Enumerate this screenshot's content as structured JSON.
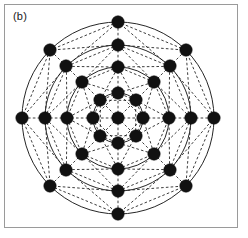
{
  "figure": {
    "panel_label": "(b)",
    "caption_text": "(b)",
    "background_color": "#ffffff",
    "frame_color": "#9a9a9a",
    "node_color": "#111111",
    "solid_edge_color": "#1a1a1a",
    "dashed_edge_color": "#1a1a1a"
  },
  "chart_data": {
    "type": "scatter",
    "title": "(b)",
    "subtitle": "",
    "xlabel": "",
    "ylabel": "",
    "grid": false,
    "legend_position": "none",
    "node_count": 33,
    "ring_count": 4,
    "nodes_per_ring": 8,
    "center": {
      "x": 118,
      "y": 118
    },
    "ring_radii": [
      25,
      51,
      73,
      96
    ],
    "ring_angles_deg": [
      0,
      45,
      90,
      135,
      180,
      225,
      270,
      315
    ],
    "node_radius_px": 6.2,
    "axis_node_x_positions": [
      22,
      45,
      67,
      93,
      118,
      143,
      168,
      191,
      214
    ],
    "axis_node_y_positions": [
      22,
      45,
      67,
      93,
      118,
      143,
      168,
      191,
      214
    ],
    "circles": [
      {
        "name": "ring-1",
        "radius": 25,
        "style": "solid"
      },
      {
        "name": "ring-2",
        "radius": 51,
        "style": "solid"
      },
      {
        "name": "ring-3",
        "radius": 73,
        "style": "solid"
      },
      {
        "name": "ring-4",
        "radius": 96,
        "style": "solid"
      }
    ],
    "edge_styles": {
      "radial_spokes": "dashed",
      "ring_chords": "dashed",
      "cross_ring_diagonals": "dashed",
      "ring_circles": "solid"
    },
    "series": [
      {
        "name": "ring-1",
        "radius": 25,
        "values": [
          {
            "angle": 0,
            "x": 143,
            "y": 118
          },
          {
            "angle": 45,
            "x": 136,
            "y": 100
          },
          {
            "angle": 90,
            "x": 118,
            "y": 93
          },
          {
            "angle": 135,
            "x": 100,
            "y": 100
          },
          {
            "angle": 180,
            "x": 93,
            "y": 118
          },
          {
            "angle": 225,
            "x": 100,
            "y": 136
          },
          {
            "angle": 270,
            "x": 118,
            "y": 143
          },
          {
            "angle": 315,
            "x": 136,
            "y": 136
          }
        ]
      },
      {
        "name": "ring-2",
        "radius": 51,
        "values": [
          {
            "angle": 0,
            "x": 169,
            "y": 118
          },
          {
            "angle": 45,
            "x": 154,
            "y": 82
          },
          {
            "angle": 90,
            "x": 118,
            "y": 67
          },
          {
            "angle": 135,
            "x": 82,
            "y": 82
          },
          {
            "angle": 180,
            "x": 67,
            "y": 118
          },
          {
            "angle": 225,
            "x": 82,
            "y": 154
          },
          {
            "angle": 270,
            "x": 118,
            "y": 169
          },
          {
            "angle": 315,
            "x": 154,
            "y": 154
          }
        ]
      },
      {
        "name": "ring-3",
        "radius": 73,
        "values": [
          {
            "angle": 0,
            "x": 191,
            "y": 118
          },
          {
            "angle": 45,
            "x": 170,
            "y": 66
          },
          {
            "angle": 90,
            "x": 118,
            "y": 45
          },
          {
            "angle": 135,
            "x": 66,
            "y": 66
          },
          {
            "angle": 180,
            "x": 45,
            "y": 118
          },
          {
            "angle": 225,
            "x": 66,
            "y": 170
          },
          {
            "angle": 270,
            "x": 118,
            "y": 191
          },
          {
            "angle": 315,
            "x": 170,
            "y": 170
          }
        ]
      },
      {
        "name": "ring-4",
        "radius": 96,
        "values": [
          {
            "angle": 0,
            "x": 214,
            "y": 118
          },
          {
            "angle": 45,
            "x": 186,
            "y": 50
          },
          {
            "angle": 90,
            "x": 118,
            "y": 22
          },
          {
            "angle": 135,
            "x": 50,
            "y": 50
          },
          {
            "angle": 180,
            "x": 22,
            "y": 118
          },
          {
            "angle": 225,
            "x": 50,
            "y": 186
          },
          {
            "angle": 270,
            "x": 118,
            "y": 214
          },
          {
            "angle": 315,
            "x": 186,
            "y": 186
          }
        ]
      },
      {
        "name": "center",
        "radius": 0,
        "values": [
          {
            "angle": 0,
            "x": 118,
            "y": 118
          }
        ]
      }
    ]
  }
}
